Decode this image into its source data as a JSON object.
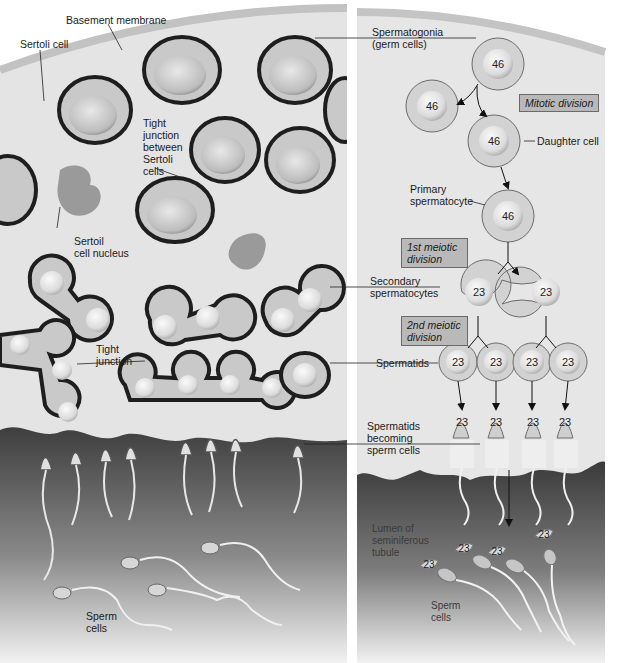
{
  "figure": {
    "colors": {
      "sertoli_bg": "#e6e6e6",
      "basement_membrane": "#c4c4c4",
      "cell_ring": "#d2d2d2",
      "cell_nucleus": "#f2f2f2",
      "lumen_dark": "#4a4a4a",
      "box_fill": "#b9b9b9",
      "ink": "#1a1a1a"
    }
  },
  "left_panel": {
    "labels": {
      "basement_membrane": "Basement membrane",
      "sertoli_cell": "Sertoli cell",
      "tight_junction_between": "Tight\njunction\nbetween\nSertoli\ncells",
      "sertoli_nucleus": "Sertoil\ncell nucleus",
      "tight_junction": "Tight\njunction",
      "sperm_cells": "Sperm\ncells"
    }
  },
  "shared_labels": {
    "spermatogonia": "Spermatogonia\n(germ cells)",
    "secondary_spermatocytes": "Secondary\nspermatocytes",
    "spermatids": "Spermatids",
    "spermatids_becoming": "Spermatids\nbecoming\nsperm cells"
  },
  "right_panel": {
    "labels": {
      "daughter_cell": "Daughter cell",
      "primary_spermatocyte": "Primary\nspermatocyte",
      "lumen": "Lumen of\nseminiferous\ntubule",
      "sperm_cells": "Sperm\ncells"
    },
    "boxes": {
      "mitotic": "Mitotic division",
      "meiotic1": "1st meiotic\ndivision",
      "meiotic2": "2nd meiotic\ndivision"
    },
    "chromosome_counts": {
      "spermatogonium": "46",
      "mitotic_left": "46",
      "daughter": "46",
      "primary": "46",
      "secondary": [
        "23",
        "23"
      ],
      "spermatids": [
        "23",
        "23",
        "23",
        "23"
      ],
      "maturing": [
        "23",
        "23",
        "23",
        "23"
      ],
      "sperm": [
        "23",
        "23",
        "23",
        "23"
      ]
    }
  }
}
